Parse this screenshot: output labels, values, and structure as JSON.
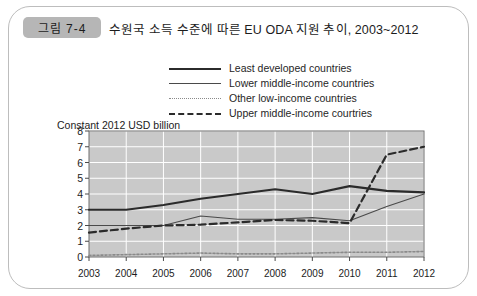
{
  "figure": {
    "badge": "그림 7-4",
    "title": "수원국 소득 수준에 따른 EU ODA 지원 추이, 2003~2012"
  },
  "colors": {
    "plot_background": "#c9c9c9",
    "gridline": "#ffffff",
    "least_developed": "#2b2b2b",
    "lower_middle": "#4a4a4a",
    "other_low": "#8a8a8a",
    "upper_middle": "#2b2b2b",
    "badge": "#b6b6b6",
    "card_border": "#bdbdbd"
  },
  "chart_data": {
    "type": "line",
    "title": "수원국 소득 수준에 따른 EU ODA 지원 추이, 2003~2012",
    "xlabel": "",
    "ylabel": "Constant 2012 USD billion",
    "categories": [
      "2003",
      "2004",
      "2005",
      "2006",
      "2007",
      "2008",
      "2009",
      "2010",
      "2011",
      "2012"
    ],
    "x": [
      2003,
      2004,
      2005,
      2006,
      2007,
      2008,
      2009,
      2010,
      2011,
      2012
    ],
    "ylim": [
      0,
      8
    ],
    "yticks": [
      0,
      1,
      2,
      3,
      4,
      5,
      6,
      7,
      8
    ],
    "grid": true,
    "legend_position": "top-center",
    "series": [
      {
        "name": "Least developed countries",
        "style": "solid-thick",
        "values": [
          3.0,
          3.0,
          3.3,
          3.7,
          4.0,
          4.3,
          4.0,
          4.5,
          4.2,
          4.1
        ]
      },
      {
        "name": "Lower middle-income countries",
        "style": "solid-thin",
        "values": [
          2.0,
          2.0,
          2.0,
          2.6,
          2.4,
          2.4,
          2.5,
          2.3,
          3.2,
          4.0
        ]
      },
      {
        "name": "Other low-income countries",
        "style": "dotted",
        "values": [
          0.1,
          0.15,
          0.2,
          0.25,
          0.2,
          0.2,
          0.25,
          0.3,
          0.3,
          0.35
        ]
      },
      {
        "name": "Upper middle-income courtries",
        "style": "dashed",
        "values": [
          1.55,
          1.8,
          2.0,
          2.05,
          2.2,
          2.35,
          2.3,
          2.15,
          6.5,
          7.0
        ]
      }
    ]
  }
}
